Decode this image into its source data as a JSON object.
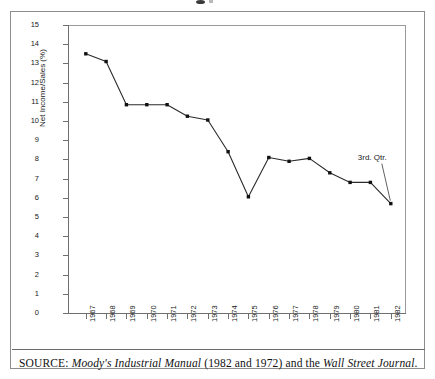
{
  "chart_data": {
    "type": "line",
    "title": "",
    "xlabel": "",
    "ylabel": "Net Income/Sales (%)",
    "categories": [
      "1967",
      "1968",
      "1969",
      "1970",
      "1971",
      "1972",
      "1973",
      "1974",
      "1975",
      "1976",
      "1977",
      "1978",
      "1979",
      "1980",
      "1981",
      "1982"
    ],
    "values": [
      13.5,
      13.1,
      10.85,
      10.85,
      10.85,
      10.25,
      10.05,
      8.4,
      6.05,
      8.1,
      7.9,
      8.05,
      7.3,
      6.8,
      6.8,
      5.7
    ],
    "ylim": [
      0,
      15
    ],
    "yticks": [
      0,
      1,
      2,
      3,
      4,
      5,
      6,
      7,
      8,
      9,
      10,
      11,
      12,
      13,
      14,
      15
    ],
    "ytick_labels": [
      "0",
      "1",
      "2",
      "3",
      "4",
      "5",
      "6",
      "7",
      "8",
      "9",
      "10",
      "11",
      "12",
      "13",
      "14",
      "15"
    ],
    "grid": false,
    "legend": "none",
    "marker": "filled-square",
    "line_color": "#2b2b2b",
    "marker_color": "#111111",
    "annotations": [
      {
        "text": "3rd. Qtr.",
        "points_to_category": "1982",
        "points_to_value": 5.7
      }
    ]
  },
  "source": {
    "prefix": "SOURCE:",
    "italic_1": "Moody's Industrial Manual",
    "middle": "(1982 and 1972) and the",
    "italic_2": "Wall Street Journal",
    "suffix": "."
  }
}
